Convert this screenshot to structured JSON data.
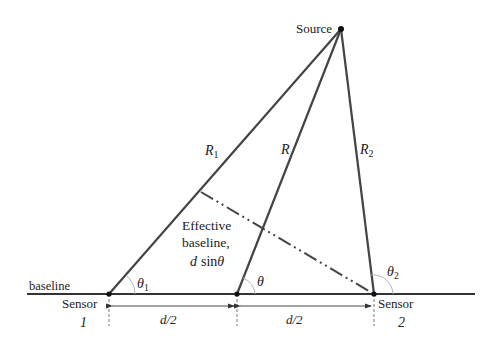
{
  "diagram": {
    "source_label": "Source",
    "baseline_label": "baseline",
    "sensor1": {
      "label": "Sensor",
      "number": "1"
    },
    "sensor2": {
      "label": "Sensor",
      "number": "2"
    },
    "ranges": {
      "r1": "R",
      "r1_sub": "1",
      "r": "R",
      "r2": "R",
      "r2_sub": "2"
    },
    "angles": {
      "theta1": "θ",
      "theta1_sub": "1",
      "theta": "θ",
      "theta2": "θ",
      "theta2_sub": "2"
    },
    "effective_baseline": {
      "line1": "Effective",
      "line2": "baseline,",
      "line3_d": "d",
      "line3_sin": "sin",
      "line3_theta": "θ"
    },
    "half_spacing_left": "d/2",
    "half_spacing_right": "d/2",
    "colors": {
      "line": "#333333",
      "text": "#222222",
      "angle_arc": "#aaaaaa"
    }
  }
}
